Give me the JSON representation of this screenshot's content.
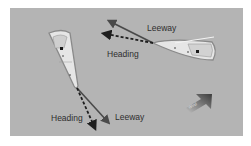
{
  "diagram": {
    "boats": [
      {
        "id": "boat-left",
        "labels": {
          "heading": "Heading",
          "leeway": "Leeway"
        }
      },
      {
        "id": "boat-right",
        "labels": {
          "heading": "Heading",
          "leeway": "Leeway"
        }
      }
    ],
    "wind_arrow": {
      "label": "Wind"
    },
    "colors": {
      "background": "#b4b4b4",
      "heading_arrow": "#1e1e1e",
      "leeway_arrow": "#4a4a4a",
      "hull": "#e8e8e8",
      "hull_outline": "#8a8a8a",
      "text": "#2e2e2e"
    }
  }
}
